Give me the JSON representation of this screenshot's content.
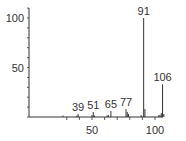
{
  "chart_data": {
    "type": "bar",
    "title": "",
    "xlabel": "",
    "ylabel": "",
    "xlim": [
      20,
      110
    ],
    "ylim": [
      0,
      110
    ],
    "x_ticks": [
      50,
      100
    ],
    "y_ticks": [
      50,
      100
    ],
    "x_minor_step": 10,
    "y_minor_step": 10,
    "grid": false,
    "legend": null,
    "peaks": [
      {
        "mz": 27,
        "intensity": 1.5
      },
      {
        "mz": 38,
        "intensity": 1.5
      },
      {
        "mz": 39,
        "intensity": 3
      },
      {
        "mz": 50,
        "intensity": 2
      },
      {
        "mz": 51,
        "intensity": 5
      },
      {
        "mz": 52,
        "intensity": 1.5
      },
      {
        "mz": 62,
        "intensity": 1.5
      },
      {
        "mz": 63,
        "intensity": 2
      },
      {
        "mz": 65,
        "intensity": 6
      },
      {
        "mz": 77,
        "intensity": 8
      },
      {
        "mz": 78,
        "intensity": 5
      },
      {
        "mz": 79,
        "intensity": 3
      },
      {
        "mz": 89,
        "intensity": 2
      },
      {
        "mz": 91,
        "intensity": 100
      },
      {
        "mz": 92,
        "intensity": 8
      },
      {
        "mz": 103,
        "intensity": 2
      },
      {
        "mz": 104,
        "intensity": 2
      },
      {
        "mz": 105,
        "intensity": 4
      },
      {
        "mz": 106,
        "intensity": 33
      },
      {
        "mz": 107,
        "intensity": 3
      }
    ],
    "annotations": [
      {
        "text": "39",
        "mz": 39
      },
      {
        "text": "51",
        "mz": 51
      },
      {
        "text": "65",
        "mz": 65
      },
      {
        "text": "77",
        "mz": 77
      },
      {
        "text": "91",
        "mz": 91
      },
      {
        "text": "106",
        "mz": 106
      }
    ],
    "colors": {
      "axis": "#333333",
      "peak": "#333333",
      "text": "#333333"
    }
  }
}
